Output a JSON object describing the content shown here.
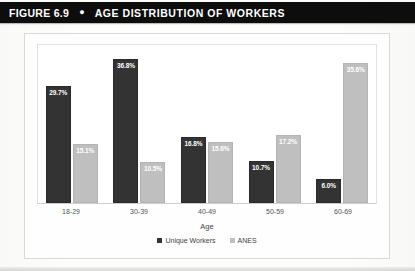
{
  "header": {
    "figure_label": "FIGURE 6.9",
    "bullet": "●",
    "title": "AGE DISTRIBUTION OF WORKERS"
  },
  "colors": {
    "title_bar_bg": "#0d0d0d",
    "title_bar_text": "#ffffff",
    "series_unique_workers": "#333333",
    "series_anes": "#bfbfbf",
    "plot_border": "#e2e2e2",
    "frame_border": "#d9d9d9"
  },
  "chart_data": {
    "type": "bar",
    "title": "AGE DISTRIBUTION OF WORKERS",
    "xlabel": "Age",
    "ylabel": "",
    "grid": false,
    "legend_position": "bottom",
    "ylim": [
      0,
      40
    ],
    "categories": [
      "18-29",
      "30-39",
      "40-49",
      "50-59",
      "60-69"
    ],
    "series": [
      {
        "name": "Unique Workers",
        "color": "#333333",
        "values": [
          29.7,
          36.8,
          16.8,
          10.7,
          6.0
        ],
        "labels": [
          "29.7%",
          "36.8%",
          "16.8%",
          "10.7%",
          "6.0%"
        ]
      },
      {
        "name": "ANES",
        "color": "#bfbfbf",
        "values": [
          15.1,
          10.5,
          15.6,
          17.2,
          35.6
        ],
        "labels": [
          "15.1%",
          "10.5%",
          "15.6%",
          "17.2%",
          "35.6%"
        ]
      }
    ]
  }
}
